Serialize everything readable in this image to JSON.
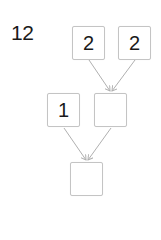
{
  "problem": {
    "number": "12"
  },
  "tree": {
    "top_left": "2",
    "top_right": "2",
    "middle_left": "1",
    "middle_right": "",
    "bottom": ""
  },
  "colors": {
    "box_border": "#c4c4c4",
    "arrow": "#b0b0b0",
    "text": "#1a1a1a"
  }
}
